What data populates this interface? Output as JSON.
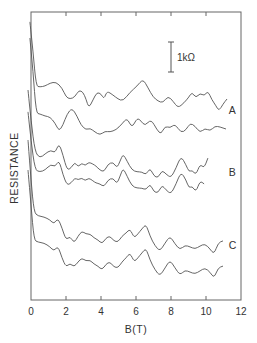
{
  "chart_data": {
    "type": "line",
    "title": "",
    "xlabel": "B(T)",
    "ylabel": "RESISTANCE",
    "xlim": [
      0,
      12
    ],
    "x_ticks": [
      0,
      2,
      4,
      6,
      8,
      10,
      12
    ],
    "x_tick_labels": [
      "0",
      "2",
      "4",
      "6",
      "8",
      "10",
      "12"
    ],
    "y_ticks": [],
    "grid": false,
    "legend": null,
    "y_units_note": "R in kΩ with arbitrary vertical offsets (curves stacked); 1 kΩ scale bar shown",
    "scale_bar": {
      "label": "1kΩ",
      "value_kohm": 1,
      "B_position": 8.0,
      "R_bottom": 7.6,
      "R_top": 8.6
    },
    "annotations": [
      {
        "text": "A",
        "B": 11.3,
        "R": 6.2
      },
      {
        "text": "B",
        "B": 11.3,
        "R": 4.13
      },
      {
        "text": "C",
        "B": 11.3,
        "R": 1.7
      }
    ],
    "series": [
      {
        "name": "A (upper trace)",
        "group": "A",
        "B": [
          -0.06,
          0.11,
          0.29,
          0.51,
          0.8,
          1.09,
          1.43,
          1.77,
          2.0,
          2.23,
          2.51,
          2.74,
          2.97,
          3.14,
          3.31,
          3.54,
          3.77,
          4.0,
          4.17,
          4.34,
          4.69,
          4.97,
          5.26,
          5.66,
          6.06,
          6.4,
          6.69,
          6.97,
          7.26,
          7.54,
          7.83,
          8.11,
          8.4,
          8.74,
          9.03,
          9.2,
          9.43,
          9.66,
          9.89,
          10.11,
          10.34,
          10.57,
          10.74,
          10.97,
          11.2
        ],
        "R": [
          9.27,
          8.33,
          7.13,
          7.1,
          7.13,
          7.23,
          7.27,
          7.07,
          6.77,
          6.7,
          6.77,
          7.0,
          6.93,
          6.7,
          6.4,
          6.67,
          6.93,
          6.87,
          6.7,
          6.97,
          6.83,
          6.7,
          6.63,
          6.93,
          7.13,
          7.37,
          7.07,
          6.77,
          6.63,
          6.57,
          6.8,
          6.63,
          6.4,
          6.57,
          6.77,
          6.93,
          6.73,
          6.9,
          6.8,
          6.97,
          6.67,
          6.47,
          6.3,
          6.53,
          6.7
        ]
      },
      {
        "name": "A (lower trace)",
        "group": "A",
        "B": [
          -0.06,
          0.11,
          0.29,
          0.51,
          0.8,
          1.09,
          1.37,
          1.6,
          1.83,
          2.06,
          2.34,
          2.63,
          2.86,
          3.14,
          3.37,
          3.66,
          3.94,
          4.23,
          4.51,
          4.86,
          5.2,
          5.49,
          5.77,
          6.06,
          6.29,
          6.51,
          6.86,
          7.2,
          7.43,
          7.66,
          7.94,
          8.23,
          8.57,
          8.86,
          9.09,
          9.37,
          9.66,
          9.94,
          10.23,
          10.51,
          10.8,
          11.14
        ],
        "R": [
          8.73,
          7.67,
          6.23,
          6.2,
          6.13,
          6.1,
          5.9,
          5.63,
          5.83,
          6.2,
          6.4,
          6.13,
          5.83,
          5.67,
          5.73,
          5.6,
          5.5,
          5.63,
          5.6,
          5.67,
          5.87,
          6.07,
          5.73,
          6.07,
          5.97,
          5.8,
          6.03,
          5.67,
          5.53,
          5.8,
          5.73,
          5.87,
          5.57,
          5.67,
          5.9,
          5.8,
          5.57,
          5.73,
          5.63,
          5.8,
          5.77,
          5.7
        ]
      },
      {
        "name": "B (upper trace)",
        "group": "B",
        "B": [
          -0.17,
          0.0,
          0.23,
          0.51,
          0.8,
          1.14,
          1.37,
          1.6,
          1.83,
          2.06,
          2.29,
          2.51,
          2.69,
          2.91,
          3.09,
          3.31,
          3.54,
          3.71,
          3.94,
          4.17,
          4.4,
          4.69,
          4.91,
          5.09,
          5.26,
          5.49,
          5.77,
          6.06,
          6.34,
          6.57,
          6.8,
          7.03,
          7.26,
          7.49,
          7.71,
          8.0,
          8.29,
          8.57,
          8.86,
          9.03,
          9.2,
          9.43,
          9.66,
          9.89,
          10.11
        ],
        "R": [
          7.0,
          6.0,
          4.93,
          4.73,
          4.87,
          5.0,
          4.9,
          5.23,
          4.83,
          4.33,
          4.4,
          4.6,
          4.43,
          4.57,
          4.47,
          4.6,
          4.53,
          4.47,
          4.33,
          4.27,
          4.53,
          4.6,
          4.4,
          4.63,
          4.87,
          4.63,
          4.33,
          4.27,
          4.27,
          4.17,
          4.4,
          4.13,
          4.07,
          4.33,
          4.2,
          4.07,
          4.4,
          4.8,
          4.5,
          4.27,
          4.33,
          4.17,
          4.53,
          4.4,
          4.73
        ]
      },
      {
        "name": "B (lower trace)",
        "group": "B",
        "B": [
          -0.17,
          0.0,
          0.23,
          0.51,
          0.8,
          1.14,
          1.37,
          1.6,
          1.83,
          2.06,
          2.29,
          2.51,
          2.69,
          2.91,
          3.09,
          3.31,
          3.54,
          3.71,
          3.94,
          4.17,
          4.4,
          4.69,
          4.91,
          5.09,
          5.26,
          5.49,
          5.77,
          6.06,
          6.34,
          6.57,
          6.8,
          7.03,
          7.26,
          7.49,
          7.71,
          8.0,
          8.29,
          8.57,
          8.86,
          9.03,
          9.2,
          9.43,
          9.66,
          9.89
        ],
        "R": [
          6.27,
          5.33,
          4.33,
          4.27,
          4.33,
          4.53,
          4.43,
          4.67,
          4.17,
          3.83,
          3.9,
          4.07,
          4.0,
          4.07,
          3.97,
          4.07,
          3.97,
          3.9,
          3.87,
          3.77,
          4.0,
          4.07,
          3.87,
          4.13,
          4.4,
          4.13,
          3.8,
          3.73,
          3.73,
          3.67,
          3.87,
          3.6,
          3.57,
          3.83,
          3.67,
          3.53,
          3.87,
          4.27,
          4.0,
          3.73,
          3.8,
          3.6,
          3.97,
          3.87
        ]
      },
      {
        "name": "C (upper trace)",
        "group": "C",
        "B": [
          -0.17,
          0.0,
          0.17,
          0.4,
          0.74,
          1.09,
          1.31,
          1.54,
          1.77,
          2.0,
          2.23,
          2.46,
          2.69,
          2.91,
          3.14,
          3.37,
          3.6,
          3.83,
          4.06,
          4.29,
          4.51,
          4.74,
          4.97,
          5.2,
          5.43,
          5.66,
          5.89,
          6.11,
          6.34,
          6.57,
          6.8,
          7.09,
          7.37,
          7.66,
          7.94,
          8.23,
          8.51,
          8.8,
          9.09,
          9.37,
          9.66,
          9.94,
          10.23,
          10.46,
          10.69,
          10.97
        ],
        "R": [
          5.33,
          4.0,
          2.93,
          2.8,
          2.77,
          2.67,
          2.53,
          2.73,
          2.4,
          2.0,
          2.13,
          1.9,
          2.13,
          2.3,
          2.2,
          2.2,
          2.07,
          2.0,
          1.87,
          2.07,
          2.13,
          1.97,
          1.93,
          2.13,
          2.23,
          2.37,
          2.07,
          2.2,
          2.37,
          2.53,
          2.13,
          1.8,
          1.63,
          1.9,
          2.13,
          1.87,
          1.67,
          1.83,
          1.77,
          1.7,
          1.8,
          1.87,
          1.7,
          1.53,
          1.9,
          1.97
        ]
      },
      {
        "name": "C (lower trace)",
        "group": "C",
        "B": [
          -0.17,
          0.0,
          0.17,
          0.4,
          0.74,
          1.09,
          1.31,
          1.54,
          1.77,
          2.0,
          2.23,
          2.46,
          2.69,
          2.91,
          3.14,
          3.37,
          3.6,
          3.83,
          4.06,
          4.29,
          4.51,
          4.74,
          4.97,
          5.2,
          5.43,
          5.66,
          5.89,
          6.11,
          6.34,
          6.57,
          6.8,
          7.09,
          7.37,
          7.66,
          7.94,
          8.23,
          8.51,
          8.8,
          9.09,
          9.37,
          9.66,
          9.94,
          10.23,
          10.46,
          10.69,
          10.97
        ],
        "R": [
          4.33,
          3.17,
          2.0,
          1.93,
          1.9,
          1.77,
          1.63,
          1.8,
          1.4,
          1.1,
          1.23,
          1.1,
          1.27,
          1.4,
          1.3,
          1.33,
          1.2,
          1.13,
          1.0,
          1.2,
          1.27,
          1.1,
          1.07,
          1.27,
          1.4,
          1.57,
          1.27,
          1.4,
          1.57,
          1.73,
          1.33,
          1.0,
          0.8,
          1.07,
          1.33,
          1.07,
          0.83,
          1.0,
          0.93,
          0.87,
          0.97,
          1.07,
          0.93,
          0.73,
          1.07,
          1.13
        ]
      }
    ]
  },
  "style": {
    "line_color": "#555555",
    "axis_color": "#666666",
    "text_color": "#333333",
    "background": "#ffffff"
  }
}
